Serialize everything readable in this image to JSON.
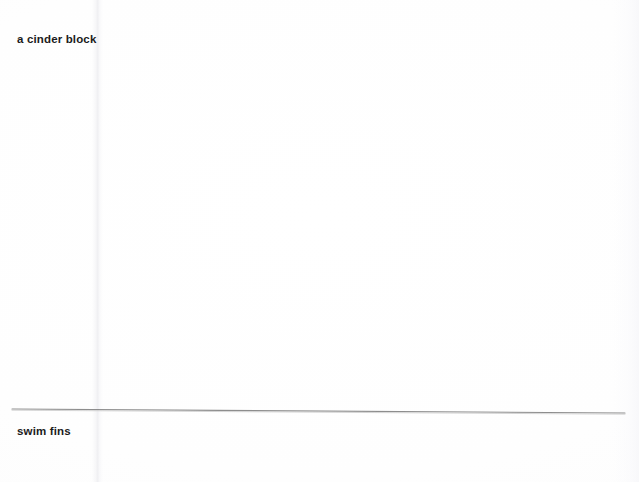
{
  "document": {
    "type": "scanned-page",
    "background_color": "#fefefe",
    "width": 639,
    "height": 482,
    "entries": [
      {
        "id": "entry-top",
        "text": "a cinder block",
        "position": {
          "x": 17,
          "y": 32
        },
        "color": "#1b1b1b"
      },
      {
        "id": "entry-bottom",
        "text": "swim fins",
        "position": {
          "x": 17,
          "y": 424
        },
        "color": "#1b1b1b"
      }
    ],
    "separator": {
      "id": "horizontal-rule",
      "color": "#8d8d8d",
      "thickness": 1,
      "start": {
        "x": 12,
        "y": 409
      },
      "end": {
        "x": 625,
        "y": 413
      }
    },
    "artifacts": {
      "fold_crease": {
        "orientation": "vertical",
        "x": 97,
        "color": "#eeeef1"
      },
      "edge_shading": {
        "side": "right",
        "color": "#f6f6f9"
      }
    }
  }
}
